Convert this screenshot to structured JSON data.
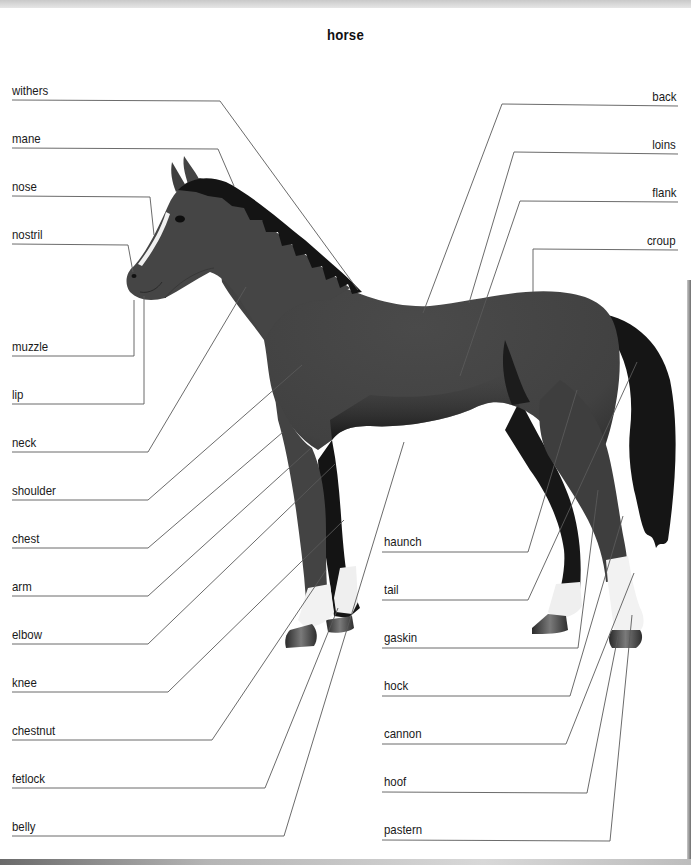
{
  "title": "horse",
  "colors": {
    "body": "#434343",
    "mane_tail": "#151515",
    "socks": "#f2f2f2",
    "hoof": "#3a3a3a",
    "leader_line": "#5a5a5a",
    "leader_line_on_body": "#bdbdbd"
  },
  "labels_left": [
    {
      "text": "withers",
      "y": 90
    },
    {
      "text": "mane",
      "y": 138
    },
    {
      "text": "nose",
      "y": 186
    },
    {
      "text": "nostril",
      "y": 234
    },
    {
      "text": "muzzle",
      "y": 346
    },
    {
      "text": "lip",
      "y": 394
    },
    {
      "text": "neck",
      "y": 442
    },
    {
      "text": "shoulder",
      "y": 490
    },
    {
      "text": "chest",
      "y": 538
    },
    {
      "text": "arm",
      "y": 586
    },
    {
      "text": "elbow",
      "y": 634
    },
    {
      "text": "knee",
      "y": 682
    },
    {
      "text": "chestnut",
      "y": 730
    },
    {
      "text": "fetlock",
      "y": 778
    },
    {
      "text": "belly",
      "y": 826
    }
  ],
  "labels_right_top": [
    {
      "text": "back",
      "y": 96
    },
    {
      "text": "loins",
      "y": 144
    },
    {
      "text": "flank",
      "y": 192
    },
    {
      "text": "croup",
      "y": 240
    }
  ],
  "labels_right_bottom": [
    {
      "text": "haunch",
      "y": 542
    },
    {
      "text": "tail",
      "y": 590
    },
    {
      "text": "gaskin",
      "y": 638
    },
    {
      "text": "hock",
      "y": 686
    },
    {
      "text": "cannon",
      "y": 734
    },
    {
      "text": "hoof",
      "y": 782
    },
    {
      "text": "pastern",
      "y": 830
    }
  ]
}
